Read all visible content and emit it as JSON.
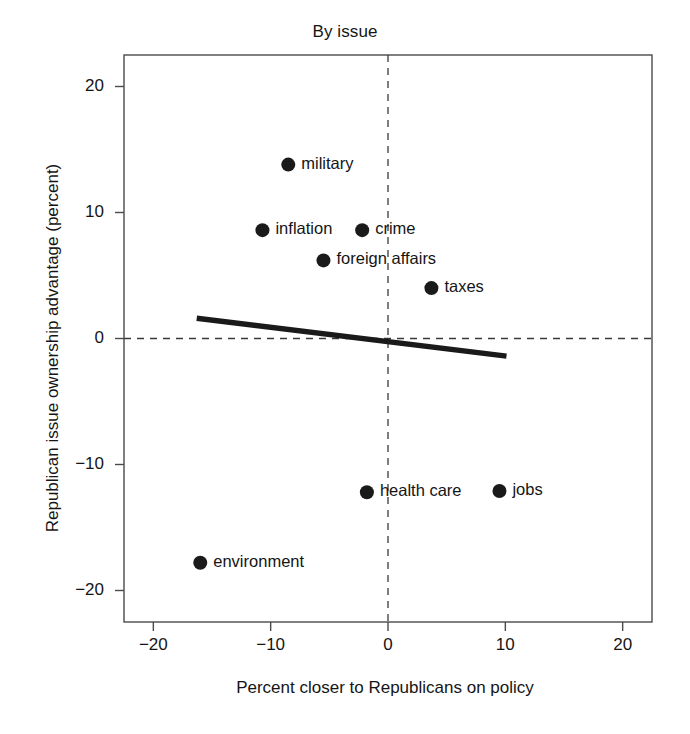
{
  "chart_data": {
    "type": "scatter",
    "title": "By issue",
    "xlabel": "Percent closer to Republicans on policy",
    "ylabel": "Republican issue ownership advantage (percent)",
    "xlim": [
      -22.5,
      22.5
    ],
    "ylim": [
      -22.5,
      22.5
    ],
    "xticks": [
      -20,
      -10,
      0,
      10,
      20
    ],
    "yticks": [
      -20,
      -10,
      0,
      10,
      20
    ],
    "xticklabels": [
      "−20",
      "−10",
      "0",
      "10",
      "20"
    ],
    "yticklabels": [
      "−20",
      "−10",
      "0",
      "10",
      "20"
    ],
    "grid": false,
    "legend": "none",
    "reference_lines": [
      {
        "name": "vertical-zero",
        "orientation": "vertical",
        "value": 0,
        "style": "dashed"
      },
      {
        "name": "horizontal-zero",
        "orientation": "horizontal",
        "value": 0,
        "style": "dashed"
      }
    ],
    "fit_line": {
      "name": "regression-line",
      "style": "solid",
      "x_start": -16.3,
      "y_start": 1.6,
      "x_end": 10.1,
      "y_end": -1.4,
      "slope": -0.114,
      "intercept": -0.24
    },
    "points": [
      {
        "label": "military",
        "x": -8.5,
        "y": 13.8,
        "label_side": "right"
      },
      {
        "label": "inflation",
        "x": -10.7,
        "y": 8.6,
        "label_side": "right"
      },
      {
        "label": "crime",
        "x": -2.2,
        "y": 8.6,
        "label_side": "right"
      },
      {
        "label": "foreign affairs",
        "x": -5.5,
        "y": 6.2,
        "label_side": "right"
      },
      {
        "label": "taxes",
        "x": 3.7,
        "y": 4.0,
        "label_side": "right"
      },
      {
        "label": "health care",
        "x": -1.8,
        "y": -12.2,
        "label_side": "right"
      },
      {
        "label": "jobs",
        "x": 9.5,
        "y": -12.1,
        "label_side": "right"
      },
      {
        "label": "environment",
        "x": -16.0,
        "y": -17.8,
        "label_side": "right"
      }
    ],
    "colors": {
      "marker": "#1a1a1a",
      "fit_line": "#1a1a1a",
      "reference_line": "#3a3a3a",
      "axis": "#4a4a4a",
      "text": "#151515",
      "background": "#ffffff"
    }
  }
}
